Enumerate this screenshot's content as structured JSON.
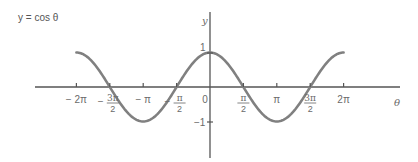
{
  "title": {
    "text": "y = cos θ"
  },
  "axes": {
    "x_label": "θ",
    "y_label": "y",
    "x_ticks": [
      {
        "label": "− 2π",
        "value": -6.2832
      },
      {
        "label": "3π/2",
        "prefix": "−",
        "num": "3π",
        "den": "2",
        "value": -4.7124
      },
      {
        "label": "− π",
        "value": -3.1416
      },
      {
        "label": "π/2",
        "prefix": "−",
        "num": "π",
        "den": "2",
        "value": -1.5708
      },
      {
        "label": "0",
        "value": 0
      },
      {
        "label": "π/2",
        "num": "π",
        "den": "2",
        "value": 1.5708
      },
      {
        "label": "π",
        "value": 3.1416
      },
      {
        "label": "3π/2",
        "num": "3π",
        "den": "2",
        "value": 4.7124
      },
      {
        "label": "2π",
        "value": 6.2832
      }
    ],
    "y_ticks": [
      {
        "label": "1",
        "value": 1
      },
      {
        "label": "−1",
        "value": -1
      }
    ]
  },
  "curve": {
    "function": "cos",
    "domain": [
      -6.2832,
      6.2832
    ],
    "color": "#7a7a7a"
  },
  "colors": {
    "axis": "#555555",
    "curve": "#808080",
    "text": "#5a5a5a"
  }
}
